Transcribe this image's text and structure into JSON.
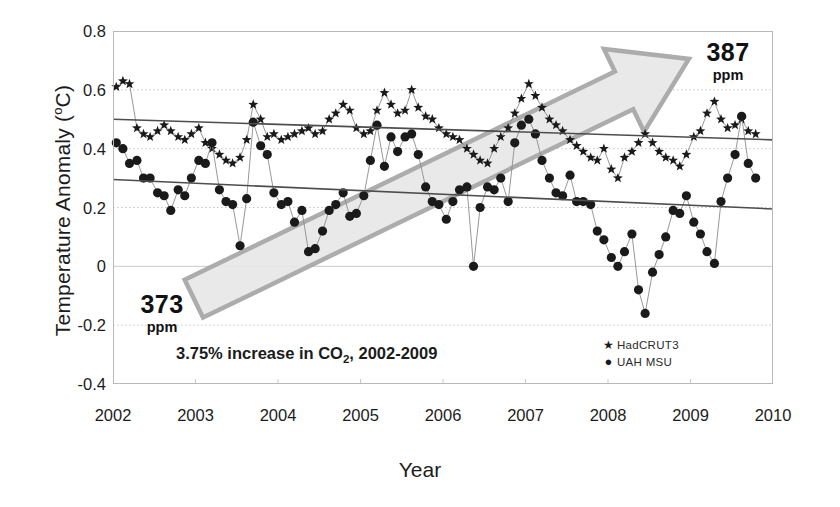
{
  "chart_data": {
    "type": "line",
    "title": "",
    "xlabel": "Year",
    "ylabel": "Temperature Anomaly (°C)",
    "xlim": [
      2002,
      2010
    ],
    "ylim": [
      -0.4,
      0.8
    ],
    "xticks": [
      "2002",
      "2003",
      "2004",
      "2005",
      "2006",
      "2007",
      "2008",
      "2009",
      "2010"
    ],
    "xtick_values": [
      2002,
      2003,
      2004,
      2005,
      2006,
      2007,
      2008,
      2009,
      2010
    ],
    "yticks": [
      "0.8",
      "0.6",
      "0.4",
      "0.2",
      "0",
      "-0.2",
      "-0.4"
    ],
    "ytick_values": [
      0.8,
      0.6,
      0.4,
      0.2,
      0,
      -0.2,
      -0.4
    ],
    "grid": true,
    "grid_style": "dotted-horizontal",
    "legend_position": "bottom-right",
    "legend": [
      {
        "label": "HadCRUT3",
        "marker": "star",
        "color": "#1a1a1a"
      },
      {
        "label": "UAH  MSU",
        "marker": "circle",
        "color": "#1a1a1a"
      }
    ],
    "series": [
      {
        "name": "HadCRUT3",
        "marker": "star",
        "color": "#1a1a1a",
        "x": [
          2002.04,
          2002.12,
          2002.2,
          2002.29,
          2002.37,
          2002.45,
          2002.54,
          2002.62,
          2002.7,
          2002.79,
          2002.87,
          2002.95,
          2003.04,
          2003.12,
          2003.2,
          2003.29,
          2003.37,
          2003.45,
          2003.54,
          2003.62,
          2003.7,
          2003.79,
          2003.87,
          2003.95,
          2004.04,
          2004.12,
          2004.2,
          2004.29,
          2004.37,
          2004.45,
          2004.54,
          2004.62,
          2004.7,
          2004.79,
          2004.87,
          2004.95,
          2005.04,
          2005.12,
          2005.2,
          2005.29,
          2005.37,
          2005.45,
          2005.54,
          2005.62,
          2005.7,
          2005.79,
          2005.87,
          2005.95,
          2006.04,
          2006.12,
          2006.2,
          2006.29,
          2006.37,
          2006.45,
          2006.54,
          2006.62,
          2006.7,
          2006.79,
          2006.87,
          2006.95,
          2007.04,
          2007.12,
          2007.2,
          2007.29,
          2007.37,
          2007.45,
          2007.54,
          2007.62,
          2007.7,
          2007.79,
          2007.87,
          2007.95,
          2008.04,
          2008.12,
          2008.2,
          2008.29,
          2008.37,
          2008.45,
          2008.54,
          2008.62,
          2008.7,
          2008.79,
          2008.87,
          2008.95,
          2009.04,
          2009.12,
          2009.2,
          2009.29,
          2009.37,
          2009.45,
          2009.54,
          2009.62,
          2009.7,
          2009.79
        ],
        "y": [
          0.61,
          0.63,
          0.62,
          0.47,
          0.45,
          0.44,
          0.46,
          0.48,
          0.46,
          0.44,
          0.43,
          0.45,
          0.47,
          0.42,
          0.4,
          0.38,
          0.36,
          0.35,
          0.37,
          0.43,
          0.55,
          0.5,
          0.44,
          0.45,
          0.43,
          0.44,
          0.45,
          0.46,
          0.47,
          0.45,
          0.46,
          0.5,
          0.52,
          0.55,
          0.53,
          0.47,
          0.45,
          0.46,
          0.53,
          0.59,
          0.55,
          0.52,
          0.53,
          0.6,
          0.54,
          0.51,
          0.5,
          0.47,
          0.45,
          0.44,
          0.43,
          0.4,
          0.38,
          0.36,
          0.35,
          0.4,
          0.44,
          0.47,
          0.52,
          0.57,
          0.62,
          0.58,
          0.54,
          0.5,
          0.48,
          0.46,
          0.43,
          0.41,
          0.39,
          0.37,
          0.36,
          0.4,
          0.33,
          0.3,
          0.37,
          0.39,
          0.42,
          0.45,
          0.42,
          0.39,
          0.37,
          0.36,
          0.34,
          0.38,
          0.44,
          0.46,
          0.52,
          0.56,
          0.5,
          0.47,
          0.48,
          0.5,
          0.46,
          0.45
        ]
      },
      {
        "name": "UAH  MSU",
        "marker": "circle",
        "color": "#1a1a1a",
        "x": [
          2002.04,
          2002.12,
          2002.2,
          2002.29,
          2002.37,
          2002.45,
          2002.54,
          2002.62,
          2002.7,
          2002.79,
          2002.87,
          2002.95,
          2003.04,
          2003.12,
          2003.2,
          2003.29,
          2003.37,
          2003.45,
          2003.54,
          2003.62,
          2003.7,
          2003.79,
          2003.87,
          2003.95,
          2004.04,
          2004.12,
          2004.2,
          2004.29,
          2004.37,
          2004.45,
          2004.54,
          2004.62,
          2004.7,
          2004.79,
          2004.87,
          2004.95,
          2005.04,
          2005.12,
          2005.2,
          2005.29,
          2005.37,
          2005.45,
          2005.54,
          2005.62,
          2005.7,
          2005.79,
          2005.87,
          2005.95,
          2006.04,
          2006.12,
          2006.2,
          2006.29,
          2006.37,
          2006.45,
          2006.54,
          2006.62,
          2006.7,
          2006.79,
          2006.87,
          2006.95,
          2007.04,
          2007.12,
          2007.2,
          2007.29,
          2007.37,
          2007.45,
          2007.54,
          2007.62,
          2007.7,
          2007.79,
          2007.87,
          2007.95,
          2008.04,
          2008.12,
          2008.2,
          2008.29,
          2008.37,
          2008.45,
          2008.54,
          2008.62,
          2008.7,
          2008.79,
          2008.87,
          2008.95,
          2009.04,
          2009.12,
          2009.2,
          2009.29,
          2009.37,
          2009.45,
          2009.54,
          2009.62,
          2009.7,
          2009.79
        ],
        "y": [
          0.42,
          0.4,
          0.35,
          0.36,
          0.3,
          0.3,
          0.25,
          0.24,
          0.19,
          0.26,
          0.24,
          0.3,
          0.36,
          0.35,
          0.42,
          0.26,
          0.22,
          0.21,
          0.07,
          0.23,
          0.49,
          0.41,
          0.38,
          0.25,
          0.21,
          0.22,
          0.15,
          0.19,
          0.05,
          0.06,
          0.12,
          0.19,
          0.21,
          0.25,
          0.17,
          0.18,
          0.24,
          0.36,
          0.48,
          0.34,
          0.44,
          0.39,
          0.44,
          0.45,
          0.38,
          0.27,
          0.22,
          0.21,
          0.16,
          0.22,
          0.26,
          0.27,
          0.0,
          0.2,
          0.27,
          0.26,
          0.3,
          0.22,
          0.42,
          0.48,
          0.5,
          0.45,
          0.36,
          0.3,
          0.25,
          0.24,
          0.31,
          0.22,
          0.22,
          0.21,
          0.12,
          0.09,
          0.03,
          0.0,
          0.05,
          0.11,
          -0.08,
          -0.16,
          -0.02,
          0.04,
          0.1,
          0.19,
          0.18,
          0.24,
          0.15,
          0.11,
          0.05,
          0.01,
          0.22,
          0.3,
          0.38,
          0.51,
          0.35,
          0.3
        ]
      }
    ],
    "trendlines": [
      {
        "name": "HadCRUT3 trend",
        "x": [
          2002.0,
          2010.0
        ],
        "y": [
          0.5,
          0.43
        ],
        "color": "#4d4d4d"
      },
      {
        "name": "UAH MSU trend",
        "x": [
          2002.0,
          2010.0
        ],
        "y": [
          0.295,
          0.195
        ],
        "color": "#4d4d4d"
      }
    ],
    "annotations": {
      "arrow": {
        "label": "co2-increase-arrow",
        "start_x": 2002.98,
        "start_y": -0.11,
        "end_x": 2008.98,
        "end_y": 0.705,
        "fill": "#e8e8e8",
        "stroke": "#a8a8a8"
      },
      "ppm_start": {
        "value": "373",
        "unit": "ppm"
      },
      "ppm_end": {
        "value": "387",
        "unit": "ppm"
      },
      "caption": {
        "prefix": "3.75% increase in CO",
        "sub": "2",
        "suffix": ", 2002-2009"
      }
    },
    "colors": {
      "marker": "#1a1a1a",
      "connector": "#8c8c8c",
      "trend": "#4d4d4d",
      "grid": "#c9c9cd",
      "frame": "#b9b9bd",
      "arrow_fill": "#e8e8e8",
      "arrow_stroke": "#a8a8a8",
      "text": "#1c1c1c",
      "background": "#ffffff"
    }
  }
}
